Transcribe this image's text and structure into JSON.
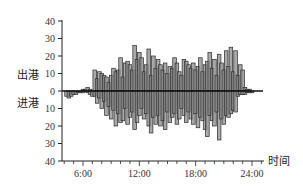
{
  "chart_data": {
    "type": "bar",
    "title": "",
    "xlabel": "时间",
    "ylabel_top": "出港",
    "ylabel_bottom": "进港",
    "x_ticks": [
      "6:00",
      "12:00",
      "18:00",
      "24:00"
    ],
    "x_range_hours": [
      3.8,
      25.5
    ],
    "y_ticks_top": [
      0,
      10,
      20,
      30,
      40
    ],
    "y_ticks_bottom": [
      10,
      20,
      30,
      40
    ],
    "ylim": [
      -40,
      40
    ],
    "bin_minutes": 15,
    "start_hour": 4.25,
    "series": [
      {
        "name": "出港",
        "direction": "up",
        "values": [
          0,
          0,
          0,
          0,
          0,
          0,
          0,
          1,
          1,
          2,
          1,
          0,
          12,
          7,
          11,
          10,
          9,
          8,
          5,
          9,
          13,
          11,
          12,
          19,
          8,
          16,
          17,
          15,
          12,
          26,
          18,
          22,
          19,
          11,
          15,
          24,
          9,
          20,
          13,
          18,
          15,
          12,
          16,
          10,
          14,
          13,
          19,
          16,
          11,
          9,
          18,
          17,
          15,
          13,
          16,
          12,
          14,
          19,
          11,
          15,
          17,
          22,
          13,
          18,
          9,
          21,
          16,
          12,
          23,
          14,
          25,
          11,
          23,
          9,
          15,
          12,
          2,
          1,
          1,
          0,
          0,
          0
        ]
      },
      {
        "name": "进港",
        "direction": "down",
        "values": [
          3,
          4,
          3,
          2,
          2,
          1,
          1,
          1,
          0,
          1,
          2,
          3,
          3,
          7,
          4,
          10,
          6,
          14,
          9,
          16,
          11,
          20,
          13,
          18,
          17,
          10,
          19,
          15,
          12,
          22,
          18,
          14,
          10,
          16,
          13,
          20,
          24,
          15,
          19,
          14,
          20,
          17,
          22,
          12,
          18,
          15,
          13,
          19,
          16,
          10,
          14,
          18,
          12,
          16,
          19,
          13,
          21,
          15,
          17,
          22,
          26,
          14,
          17,
          20,
          12,
          28,
          16,
          19,
          14,
          15,
          13,
          11,
          12,
          3,
          2,
          2,
          2,
          1,
          1,
          1,
          0,
          0
        ]
      }
    ],
    "grid": false,
    "legend": null
  },
  "colors": {
    "bar_fill": "#8c8c8c",
    "bar_stroke": "#2a2a2a",
    "axis": "#222222",
    "baseline": "#111111"
  }
}
